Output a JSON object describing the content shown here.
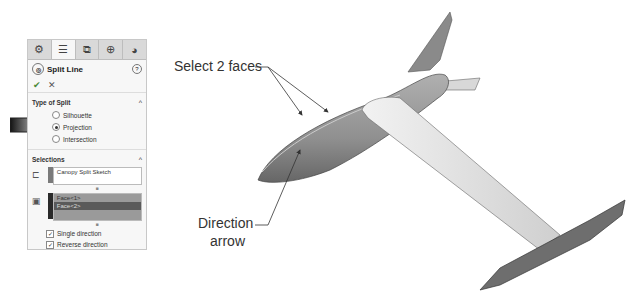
{
  "panel": {
    "tabs": [
      {
        "name": "feature-manager-icon",
        "glyph": "⚙",
        "active": false
      },
      {
        "name": "property-manager-icon",
        "glyph": "☰",
        "active": true
      },
      {
        "name": "configuration-manager-icon",
        "glyph": "⧉",
        "active": false
      },
      {
        "name": "dimxpert-icon",
        "glyph": "⊕",
        "active": false
      },
      {
        "name": "display-manager-icon",
        "glyph": "◕",
        "active": false
      }
    ],
    "title": "Split Line",
    "help": "?",
    "ok": "✔",
    "cancel": "✕",
    "type_of_split": {
      "heading": "Type of Split",
      "options": [
        {
          "label": "Silhouette",
          "selected": false
        },
        {
          "label": "Projection",
          "selected": true
        },
        {
          "label": "Intersection",
          "selected": false
        }
      ]
    },
    "selections": {
      "heading": "Selections",
      "sketch": "Canopy Split Sketch",
      "faces": [
        "Face<1>",
        "Face<2>"
      ],
      "single_direction": {
        "label": "Single direction",
        "checked": true
      },
      "reverse_direction": {
        "label": "Reverse direction",
        "checked": true
      }
    },
    "caret": "^"
  },
  "callouts": {
    "select_faces": "Select 2 faces",
    "direction_line1": "Direction",
    "direction_line2": "arrow"
  },
  "colors": {
    "sketch_bar": "#7a7a7a",
    "faces_bar": "#2a2a2a",
    "body_gray": "#8c8c8c",
    "wing_light": "#e6e6e6"
  }
}
